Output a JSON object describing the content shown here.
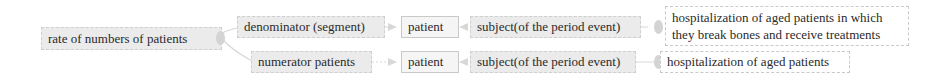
{
  "diagram": {
    "root": {
      "label": "rate of numbers of patients"
    },
    "branches": [
      {
        "segment": "denominator (segment)",
        "entity": "patient",
        "relation": "subject(of the period event)",
        "event": "hospitalization of aged patients in which they break bones and receive treatments",
        "event_lines": [
          "hospitalization of aged patients in which",
          "they break bones and receive treatments"
        ]
      },
      {
        "segment": "numerator patients",
        "entity": "patient",
        "relation": "subject(of the period event)",
        "event": "hospitalization of aged patients"
      }
    ],
    "colors": {
      "node_fill": "#ebebeb",
      "node_border": "#cfcfcf",
      "connector": "#d0d0d0",
      "text": "#2a2a2a"
    }
  }
}
